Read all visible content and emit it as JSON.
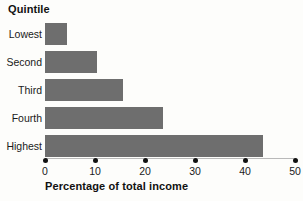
{
  "chart_data": {
    "type": "bar",
    "orientation": "horizontal",
    "title": "",
    "categories": [
      "Lowest",
      "Second",
      "Third",
      "Fourth",
      "Highest"
    ],
    "values": [
      4.4,
      10.4,
      15.6,
      23.6,
      43.6
    ],
    "series": [
      {
        "name": "Percentage of total income",
        "values": [
          4.4,
          10.4,
          15.6,
          23.6,
          43.6
        ]
      }
    ],
    "xlabel": "Percentage of total income",
    "ylabel": "Quintile",
    "xlim": [
      0,
      50
    ],
    "ylim": null,
    "xticks": [
      0,
      10,
      20,
      30,
      40,
      50
    ],
    "xtick_labels": [
      "0",
      "10",
      "20",
      "30",
      "40",
      "50"
    ],
    "grid": false,
    "legend": null,
    "bar_color": "#6e6e6e",
    "axis_color": "#b9b9b9",
    "text_color": "#1a1a1a",
    "background": "#fdfdfb",
    "tick_marker_style": "dot"
  },
  "axes": {
    "y_title": "Quintile",
    "x_title": "Percentage of total income"
  },
  "ticks": [
    {
      "value": "0"
    },
    {
      "value": "10"
    },
    {
      "value": "20"
    },
    {
      "value": "30"
    },
    {
      "value": "40"
    },
    {
      "value": "50"
    }
  ],
  "bars": [
    {
      "label": "Lowest",
      "value": 4.4
    },
    {
      "label": "Second",
      "value": 10.4
    },
    {
      "label": "Third",
      "value": 15.6
    },
    {
      "label": "Fourth",
      "value": 23.6
    },
    {
      "label": "Highest",
      "value": 43.6
    }
  ]
}
